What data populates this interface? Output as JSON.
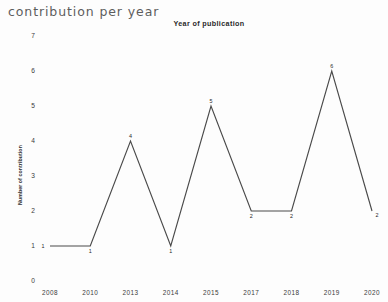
{
  "page": {
    "heading": "contribution per year"
  },
  "chart_data": {
    "type": "line",
    "title": "Year of publication",
    "xlabel": "",
    "ylabel": "Number of contribution",
    "categories": [
      "2008",
      "2010",
      "2013",
      "2014",
      "2015",
      "2017",
      "2018",
      "2019",
      "2020"
    ],
    "values": [
      1,
      1,
      4,
      1,
      5,
      2,
      2,
      6,
      2
    ],
    "point_labels": [
      "1",
      "1",
      "4",
      "1",
      "5",
      "2",
      "2",
      "6",
      "2"
    ],
    "yticks": [
      "0",
      "1",
      "2",
      "3",
      "4",
      "5",
      "6",
      "7"
    ],
    "ylim": [
      0,
      7
    ],
    "grid": false,
    "legend": false,
    "line_color": "#4a4a4a",
    "text_color": "#3a3a3a"
  }
}
